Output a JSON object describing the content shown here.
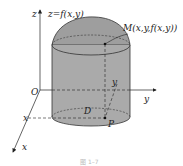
{
  "diagram": {
    "colors": {
      "fill": "#aaaaaa",
      "stroke": "#333333",
      "background": "#ffffff"
    },
    "labels": {
      "z_axis": "z",
      "surface": "z=f(x,y)",
      "point_m": "M(x,y,f(x,y))",
      "origin": "O",
      "y_axis": "y",
      "x_axis": "x",
      "x_coord": "x",
      "y_coord": "y",
      "region": "D",
      "point_p": "P",
      "caption": "图 1–7"
    }
  }
}
